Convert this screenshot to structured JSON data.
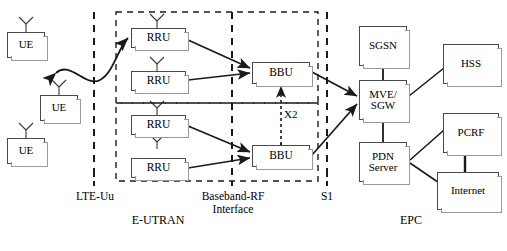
{
  "diagram": {
    "caption": "",
    "colors": {
      "line": "#1a1a1a",
      "box_border": "#4a4a4a",
      "shadow_border": "#9a9a9a",
      "background": "#ffffff",
      "text": "#000000"
    }
  },
  "nodes": {
    "ue": [
      {
        "id": "ue-1",
        "label": "UE"
      },
      {
        "id": "ue-2",
        "label": "UE"
      },
      {
        "id": "ue-3",
        "label": "UE"
      }
    ],
    "rru": [
      {
        "id": "rru-1",
        "label": "RRU"
      },
      {
        "id": "rru-2",
        "label": "RRU"
      },
      {
        "id": "rru-3",
        "label": "RRU"
      },
      {
        "id": "rru-4",
        "label": "RRU"
      }
    ],
    "bbu": [
      {
        "id": "bbu-1",
        "label": "BBU"
      },
      {
        "id": "bbu-2",
        "label": "BBU"
      }
    ],
    "core": [
      {
        "id": "sgsn",
        "label": "SGSN"
      },
      {
        "id": "mve-sgw",
        "label": "MVE/\nSGW",
        "line1": "MVE/",
        "line2": "SGW"
      },
      {
        "id": "pdn-server",
        "label": "PDN\nServer",
        "line1": "PDN",
        "line2": "Server"
      },
      {
        "id": "hss",
        "label": "HSS"
      },
      {
        "id": "pcrf",
        "label": "PCRF"
      },
      {
        "id": "internet",
        "label": "Internet"
      }
    ]
  },
  "interfaces": {
    "lte_uu": "LTE-Uu",
    "baseband_rf_line1": "Baseband-RF",
    "baseband_rf_line2": "Interface",
    "s1": "S1",
    "x2": "X2"
  },
  "regions": {
    "eutran": "E-UTRAN",
    "epc": "EPC"
  }
}
